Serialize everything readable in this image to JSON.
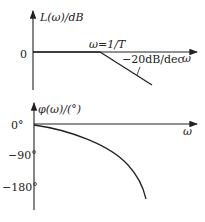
{
  "magnitude_plot": {
    "y_axis_label": "L(ω)/dB",
    "x_axis_label": "ω",
    "zero_tick": "0",
    "break_label": "ω=1/T",
    "slope_label": "−20dB/dec"
  },
  "phase_plot": {
    "y_axis_label": "φ(ω)/(°)",
    "x_axis_label": "ω",
    "ticks": [
      "0°",
      "−90°",
      "−180°"
    ]
  },
  "colors": {
    "line": "#222222",
    "background": "#ffffff"
  }
}
